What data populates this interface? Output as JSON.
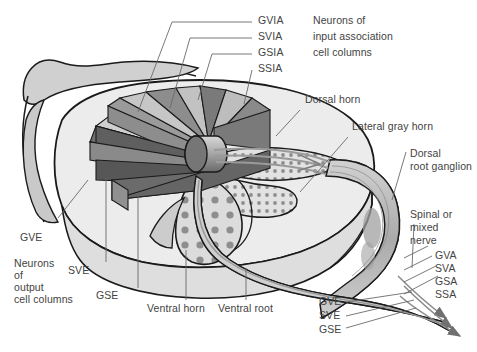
{
  "figure": {
    "type": "anatomical-diagram",
    "background_color": "#ffffff",
    "ink_color": "#434343",
    "palette": {
      "white_matter": "#e8e8e8",
      "gray_matter": "#d9d9d9",
      "wedge_light": "#c9c9c9",
      "wedge_mid": "#a8a8a8",
      "wedge_dark": "#6f6f6f",
      "wedge_darkest": "#555555",
      "nerve": "#b5b5b5",
      "outline": "#1a1a1a",
      "dot": "#8e8e8e"
    }
  },
  "labels": {
    "input_association": {
      "codes": [
        "GVIA",
        "SVIA",
        "GSIA",
        "SSIA"
      ],
      "caption_lines": [
        "Neurons of",
        "input association",
        "cell columns"
      ]
    },
    "output_columns": {
      "gve": "GVE",
      "caption_lines": [
        "Neurons",
        "of",
        "output",
        "cell columns"
      ],
      "sve": "SVE",
      "gse": "GSE"
    },
    "structures": {
      "dorsal_horn": "Dorsal horn",
      "lateral_gray_horn": "Lateral gray horn",
      "dorsal_root_ganglion_lines": [
        "Dorsal",
        "root ganglion"
      ],
      "spinal_mixed_nerve_lines": [
        "Spinal or",
        "mixed",
        "nerve"
      ],
      "ventral_horn": "Ventral horn",
      "ventral_root": "Ventral root"
    },
    "afferent_codes": [
      "GVA",
      "SVA",
      "GSA",
      "SSA"
    ],
    "efferent_codes": [
      "GVE",
      "SVE",
      "GSE"
    ]
  }
}
